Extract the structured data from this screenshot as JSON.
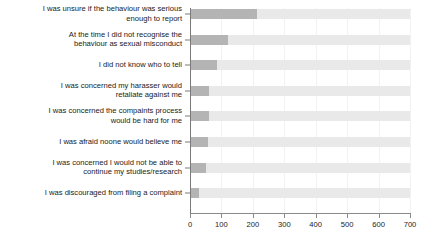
{
  "chart_data": {
    "type": "bar",
    "orientation": "horizontal",
    "title": "",
    "subtitle": "",
    "xlabel": "",
    "ylabel": "",
    "xlim": [
      0,
      700
    ],
    "xticks": [
      0,
      100,
      200,
      300,
      400,
      500,
      600,
      700
    ],
    "xtick_labels": [
      "0",
      "100",
      "200",
      "300",
      "400",
      "500",
      "600",
      "700"
    ],
    "grid": true,
    "grid_axis": "x",
    "legend": false,
    "legend_position": "none",
    "track_max": 700,
    "categories": [
      "I was unsure if the behaviour was serious\nenough to report",
      "At the time I did not recognise the\nbehaviour as sexual misconduct",
      "I did not know who to tell",
      "I was concerned my harasser would\nretaliate against me",
      "I was concerned the compaints process\nwould be hard for me",
      "I was afraid noone would believe me",
      "I was concerned I would not be able to\ncontinue my studies/research",
      "I was discouraged from filing a complaint"
    ],
    "values": [
      213,
      121,
      86,
      60,
      60,
      57,
      51,
      28
    ],
    "series": [
      {
        "name": "Count",
        "values": [
          213,
          121,
          86,
          60,
          60,
          57,
          51,
          28
        ]
      }
    ],
    "colors": {
      "bar_value": "#b4b4b4",
      "bar_track": "#e9e9e9",
      "gridline": "#f2f2f2",
      "axis": "#7a7a7a",
      "text": "#1a1a1a",
      "background": "#ffffff"
    }
  }
}
